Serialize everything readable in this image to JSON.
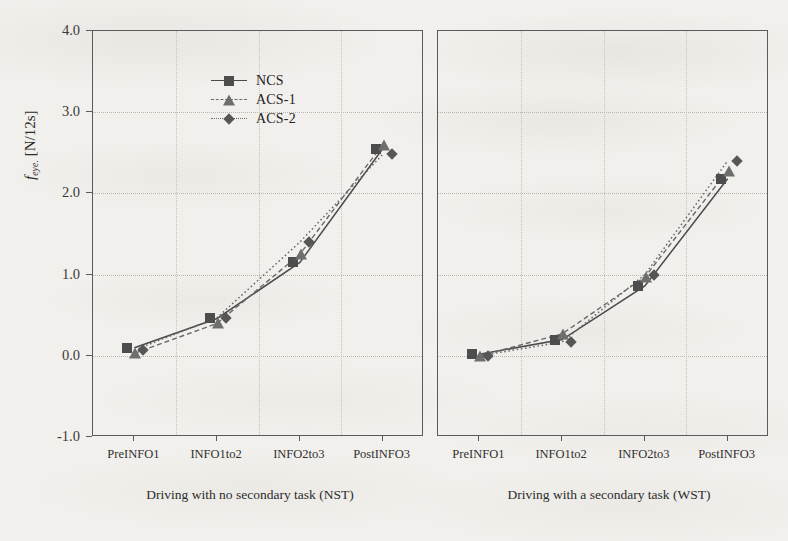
{
  "figure": {
    "y_axis_title_symbol": "f",
    "y_axis_title_sub": "eye.",
    "y_axis_title_unit": " [N/12s]"
  },
  "legend": {
    "position": "top-left",
    "items": [
      {
        "label": "NCS",
        "marker": "square-marker",
        "line": "solid",
        "color": "#4d4d4d"
      },
      {
        "label": "ACS-1",
        "marker": "triangle-marker",
        "line": "dashed",
        "color": "#6e6e6e"
      },
      {
        "label": "ACS-2",
        "marker": "diamond-marker",
        "line": "dotted",
        "color": "#565656"
      }
    ]
  },
  "captions": {
    "left": "Driving with no secondary task (NST)",
    "right": "Driving with a secondary task (WST)"
  },
  "chart_data": [
    {
      "type": "line",
      "panel": "left",
      "title": "Driving with no secondary task (NST)",
      "xlabel": "",
      "ylabel": "f_eye. [N/12s]",
      "categories": [
        "PreINFO1",
        "INFO1to2",
        "INFO2to3",
        "PostINFO3"
      ],
      "ylim": [
        -1.0,
        4.0
      ],
      "yticks": [
        "-1.0",
        "0.0",
        "1.0",
        "2.0",
        "3.0",
        "4.0"
      ],
      "ytick_values": [
        -1.0,
        0.0,
        1.0,
        2.0,
        3.0,
        4.0
      ],
      "grid": true,
      "legend": "top-left",
      "series": [
        {
          "name": "NCS",
          "values": [
            0.1,
            0.46,
            1.15,
            2.55
          ],
          "marker": "square",
          "line": "solid"
        },
        {
          "name": "ACS-1",
          "values": [
            0.03,
            0.4,
            1.25,
            2.6
          ],
          "marker": "triangle",
          "line": "dashed"
        },
        {
          "name": "ACS-2",
          "values": [
            0.07,
            0.47,
            1.4,
            2.48
          ],
          "marker": "diamond",
          "line": "dotted"
        }
      ]
    },
    {
      "type": "line",
      "panel": "right",
      "title": "Driving with a secondary task (WST)",
      "xlabel": "",
      "ylabel": "f_eye. [N/12s]",
      "categories": [
        "PreINFO1",
        "INFO1to2",
        "INFO2to3",
        "PostINFO3"
      ],
      "ylim": [
        -1.0,
        4.0
      ],
      "yticks": [
        "-1.0",
        "0.0",
        "1.0",
        "2.0",
        "3.0",
        "4.0"
      ],
      "ytick_values": [
        -1.0,
        0.0,
        1.0,
        2.0,
        3.0,
        4.0
      ],
      "grid": true,
      "legend": "none",
      "series": [
        {
          "name": "NCS",
          "values": [
            0.02,
            0.2,
            0.86,
            2.18
          ],
          "marker": "square",
          "line": "solid"
        },
        {
          "name": "ACS-1",
          "values": [
            0.0,
            0.27,
            0.97,
            2.28
          ],
          "marker": "triangle",
          "line": "dashed"
        },
        {
          "name": "ACS-2",
          "values": [
            0.0,
            0.17,
            1.0,
            2.4
          ],
          "marker": "diamond",
          "line": "dotted"
        }
      ]
    }
  ]
}
